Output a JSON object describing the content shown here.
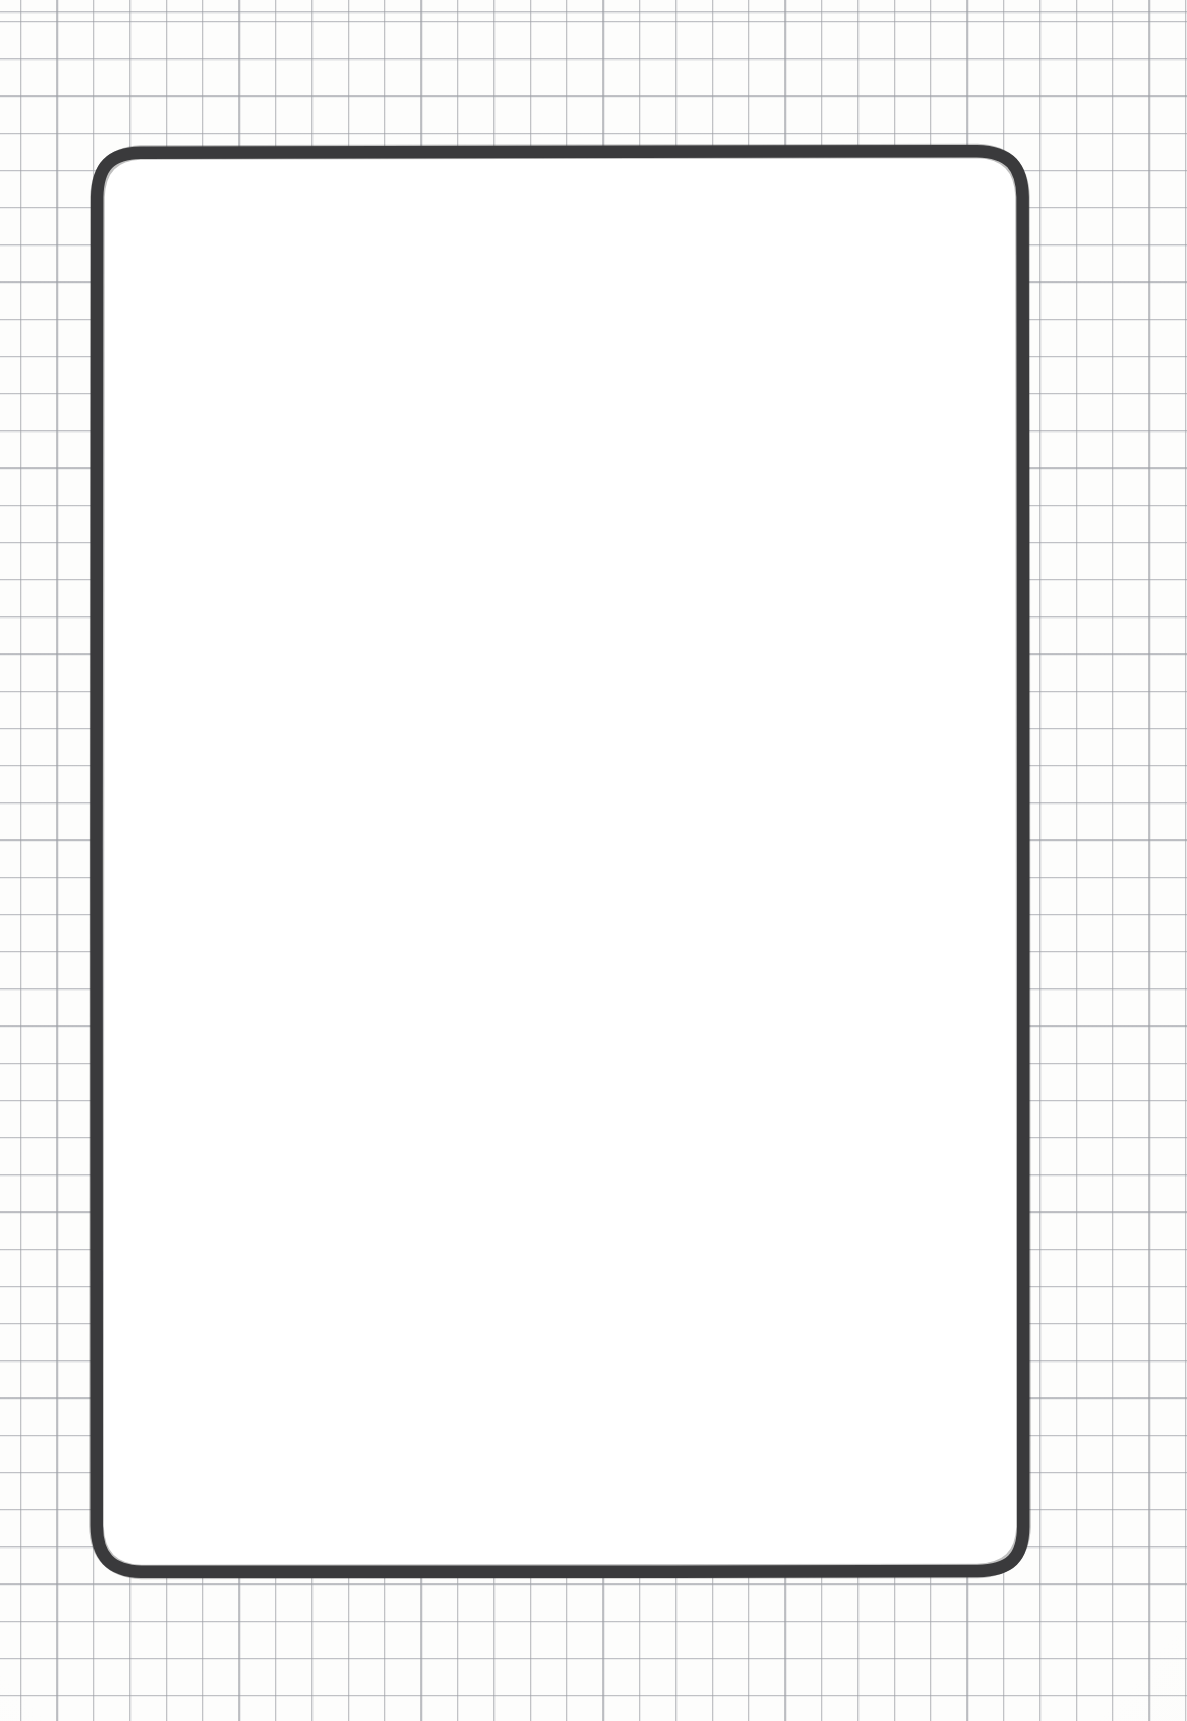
{
  "page": {
    "kind": "hand-drawn-sketch",
    "medium": "graph paper",
    "width": 1187,
    "height": 1721,
    "visible_text": "",
    "notes_label": ""
  },
  "paper": {
    "name": "graph-paper-background",
    "background_color": "#fdfdfc",
    "grid_line_color": "#96989e",
    "grid_cell_width": 36.4,
    "grid_cell_height": 37.2,
    "grid_offset_x": 20,
    "grid_offset_y": 21
  },
  "frame": {
    "name": "rounded-rectangle-outline",
    "label": "",
    "stroke_color": "#3a3a3c",
    "fill_color": "#ffffff",
    "stroke_width": 13,
    "corner_radius": 45,
    "left": 88,
    "top": 146,
    "right": 1031,
    "bottom": 1580,
    "width": 943,
    "height": 1434
  },
  "content": {
    "name": "empty-canvas-area",
    "items": [],
    "placeholder": ""
  }
}
